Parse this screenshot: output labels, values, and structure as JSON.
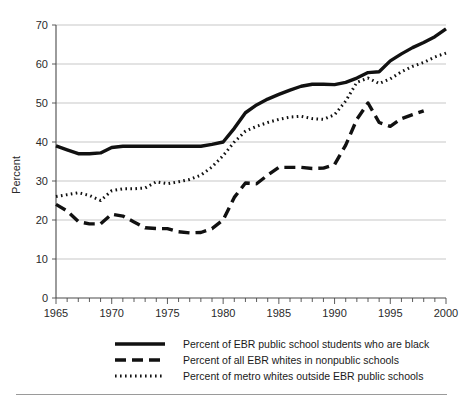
{
  "figure": {
    "type": "line-chart-figure",
    "background": "#ffffff",
    "line_color": "#111111",
    "grid_color": "#b9b9b9",
    "axis_color": "#4a4a4a"
  },
  "chart_data": {
    "type": "line",
    "title": "",
    "subtitle": "",
    "xlabel": "",
    "ylabel": "Percent",
    "xlim": [
      1965,
      2000
    ],
    "ylim": [
      0,
      70
    ],
    "grid": true,
    "grid_axis": "y",
    "legend_position": "bottom",
    "y_ticks": [
      0,
      10,
      20,
      30,
      40,
      50,
      60,
      70
    ],
    "y_tick_labels": [
      "0",
      "10",
      "20",
      "30",
      "40",
      "50",
      "60",
      "70"
    ],
    "x_ticks": [
      1965,
      1970,
      1975,
      1980,
      1985,
      1990,
      1995,
      2000
    ],
    "x_tick_labels": [
      "1965",
      "1970",
      "1975",
      "1980",
      "1985",
      "1990",
      "1995",
      "2000"
    ],
    "x_minor_tick_step": 1,
    "series": [
      {
        "name": "Percent of EBR public school students who are black",
        "style": "solid",
        "stroke_width": 3.4,
        "dasharray": "none",
        "x": [
          1965,
          1966,
          1967,
          1968,
          1969,
          1970,
          1971,
          1972,
          1973,
          1974,
          1975,
          1976,
          1977,
          1978,
          1979,
          1980,
          1981,
          1982,
          1983,
          1984,
          1985,
          1986,
          1987,
          1988,
          1989,
          1990,
          1991,
          1992,
          1993,
          1994,
          1995,
          1996,
          1997,
          1998,
          1999,
          2000
        ],
        "values": [
          39.0,
          38.0,
          37.0,
          37.0,
          37.2,
          38.6,
          38.9,
          38.9,
          38.9,
          38.9,
          38.9,
          38.9,
          38.9,
          38.9,
          39.4,
          40.0,
          43.5,
          47.5,
          49.5,
          51.0,
          52.2,
          53.3,
          54.3,
          54.8,
          54.8,
          54.7,
          55.3,
          56.4,
          57.8,
          58.0,
          60.8,
          62.6,
          64.2,
          65.5,
          67.0,
          69.0
        ]
      },
      {
        "name": "Percent of all EBR whites in nonpublic schools",
        "style": "dashed",
        "stroke_width": 3.4,
        "dasharray": "11 6",
        "x": [
          1965,
          1966,
          1967,
          1968,
          1969,
          1970,
          1971,
          1972,
          1973,
          1974,
          1975,
          1976,
          1977,
          1978,
          1979,
          1980,
          1981,
          1982,
          1983,
          1984,
          1985,
          1986,
          1987,
          1988,
          1989,
          1990,
          1991,
          1992,
          1993,
          1994,
          1995,
          1996,
          1997,
          1998
        ],
        "values": [
          24.0,
          22.3,
          19.6,
          19.0,
          19.0,
          21.5,
          21.0,
          19.5,
          18.0,
          17.8,
          17.8,
          17.0,
          16.7,
          16.8,
          17.8,
          20.0,
          25.8,
          29.5,
          29.3,
          31.5,
          33.5,
          33.5,
          33.5,
          33.2,
          33.3,
          34.2,
          39.2,
          45.8,
          50.0,
          45.0,
          44.0,
          46.0,
          47.0,
          48.0
        ]
      },
      {
        "name": "Percent of metro whites outside EBR public schools",
        "style": "dotted",
        "stroke_width": 3.0,
        "dasharray": "1.6 3.4",
        "x": [
          1965,
          1966,
          1967,
          1968,
          1969,
          1970,
          1971,
          1972,
          1973,
          1974,
          1975,
          1976,
          1977,
          1978,
          1979,
          1980,
          1981,
          1982,
          1983,
          1984,
          1985,
          1986,
          1987,
          1988,
          1989,
          1990,
          1991,
          1992,
          1993,
          1994,
          1995,
          1996,
          1997,
          1998,
          1999,
          2000
        ],
        "values": [
          26.0,
          26.5,
          27.0,
          26.3,
          25.0,
          27.5,
          28.0,
          28.0,
          28.2,
          29.8,
          29.3,
          29.8,
          30.4,
          31.5,
          33.6,
          36.5,
          40.0,
          42.8,
          44.0,
          45.0,
          45.8,
          46.4,
          46.6,
          46.0,
          45.8,
          47.0,
          50.5,
          55.3,
          56.4,
          55.0,
          56.2,
          58.0,
          59.4,
          60.4,
          61.8,
          62.8
        ]
      }
    ]
  },
  "legend": {
    "items": [
      {
        "label": "Percent of EBR public school students who are black",
        "swatch": "solid"
      },
      {
        "label": "Percent of all EBR whites in nonpublic schools",
        "swatch": "dashed"
      },
      {
        "label": "Percent of metro whites outside EBR public schools",
        "swatch": "dotted"
      }
    ]
  }
}
